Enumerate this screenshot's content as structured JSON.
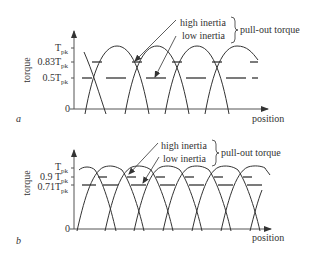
{
  "panels": [
    {
      "id": "a",
      "panel_label": "a",
      "y_axis_label": "torque",
      "x_axis_label": "position",
      "ticks": [
        {
          "main": "T",
          "sub": "pk",
          "value": 1.0
        },
        {
          "main": "0.83T",
          "sub": "pk",
          "value": 0.83
        },
        {
          "main": "0.5T",
          "sub": "pk",
          "value": 0.5
        },
        {
          "main": "0",
          "sub": "",
          "value": 0
        }
      ],
      "annotations": {
        "high_inertia": "high inertia",
        "low_inertia": "low inertia",
        "pull_out_torque": "pull-out torque"
      },
      "high_inertia_level": 0.83,
      "low_inertia_level": 0.5
    },
    {
      "id": "b",
      "panel_label": "b",
      "y_axis_label": "torque",
      "x_axis_label": "position",
      "ticks": [
        {
          "main": "T",
          "sub": "pk",
          "value": 1.0
        },
        {
          "main": "0.9 T",
          "sub": "pk",
          "value": 0.9
        },
        {
          "main": "0.71T",
          "sub": "pk",
          "value": 0.71
        },
        {
          "main": "0",
          "sub": "",
          "value": 0
        }
      ],
      "annotations": {
        "high_inertia": "high inertia",
        "low_inertia": "low inertia",
        "pull_out_torque": "pull-out torque"
      },
      "high_inertia_level": 0.9,
      "low_inertia_level": 0.71
    }
  ],
  "colors": {
    "line": "#333333",
    "axis": "#555555"
  }
}
